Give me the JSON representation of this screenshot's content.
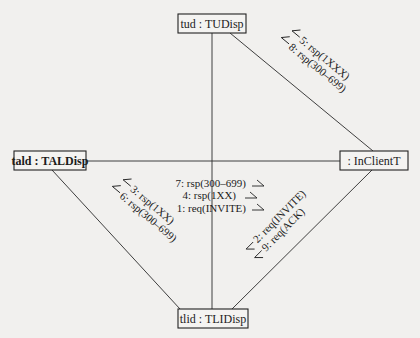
{
  "diagram": {
    "type": "UML communication diagram",
    "objects": {
      "tud": {
        "label": "tud : TUDisp"
      },
      "tald": {
        "label": "tald : TALDisp"
      },
      "inclient": {
        "label": ": InClientT"
      },
      "tlid": {
        "label": "tlid : TLIDisp"
      }
    },
    "links": [
      {
        "from": "tud",
        "to": "tlid"
      },
      {
        "from": "tald",
        "to": "inclient"
      },
      {
        "from": "tud",
        "to": "inclient"
      },
      {
        "from": "tald",
        "to": "tlid"
      },
      {
        "from": "inclient",
        "to": "tlid"
      }
    ],
    "messages": {
      "center": [
        {
          "text": "7: rsp(300–699)",
          "direction": "right"
        },
        {
          "text": "4: rsp(1XX)",
          "direction": "right"
        },
        {
          "text": "1: req(INVITE)",
          "direction": "right"
        }
      ],
      "tud_inclient": [
        {
          "text": "5: rsp(1XXX)",
          "direction": "up-left"
        },
        {
          "text": "8: rsp(300–699)",
          "direction": "up-left"
        }
      ],
      "tald_tlid": [
        {
          "text": "3: rsp(1XX)",
          "direction": "up-left"
        },
        {
          "text": "6: rsp(300–699)",
          "direction": "up-left"
        }
      ],
      "inclient_tlid": [
        {
          "text": "2: req(INVITE)",
          "direction": "down-left"
        },
        {
          "text": "9: req(ACK)",
          "direction": "down-left"
        }
      ]
    }
  }
}
